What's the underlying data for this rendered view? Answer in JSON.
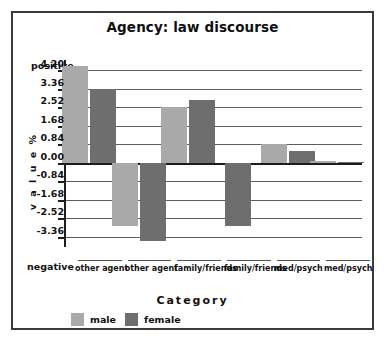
{
  "chart_data": {
    "type": "bar",
    "title": "Agency: law discourse",
    "xlabel": "Category",
    "ylabel": "v a l u e   %",
    "axis_pos_label": "positive",
    "axis_neg_label": "negative",
    "categories": [
      "other agent",
      "other agent",
      "family/friends",
      "family/friends",
      "med/psych",
      "med/psych"
    ],
    "series": [
      {
        "name": "male",
        "color": "#a9a9a9",
        "values": [
          4.38,
          null,
          2.52,
          null,
          0.84,
          0.06
        ]
      },
      {
        "name": "female",
        "color": "#6e6e6e",
        "values": [
          3.36,
          null,
          2.87,
          null,
          0.55,
          0.05
        ]
      }
    ],
    "bars": [
      {
        "group": 0,
        "series": "male",
        "category": "other agent",
        "value": 4.38
      },
      {
        "group": 0,
        "series": "female",
        "category": "other agent",
        "value": 3.36
      },
      {
        "group": 1,
        "series": "male",
        "category": "other agent",
        "value": -2.85
      },
      {
        "group": 1,
        "series": "female",
        "category": "other agent",
        "value": -3.55
      },
      {
        "group": 2,
        "series": "male",
        "category": "family/friends",
        "value": 2.52
      },
      {
        "group": 2,
        "series": "female",
        "category": "family/friends",
        "value": 2.87
      },
      {
        "group": 3,
        "series": "female",
        "category": "family/friends",
        "value": -2.85
      },
      {
        "group": 4,
        "series": "male",
        "category": "med/psych",
        "value": 0.84
      },
      {
        "group": 4,
        "series": "female",
        "category": "med/psych",
        "value": 0.55
      },
      {
        "group": 5,
        "series": "male",
        "category": "med/psych",
        "value": 0.06
      },
      {
        "group": 5,
        "series": "female",
        "category": "med/psych",
        "value": 0.05
      }
    ],
    "ytick_labels": [
      "4.20",
      "3.36",
      "2.52",
      "1.68",
      "0.84",
      "0.00",
      "-0.84",
      "-1.68",
      "-2.52",
      "-3.36"
    ],
    "ytick_values": [
      4.2,
      3.36,
      2.52,
      1.68,
      0.84,
      0.0,
      -0.84,
      -1.68,
      -2.52,
      -3.36
    ],
    "ylim": [
      -3.78,
      4.62
    ],
    "grid": true,
    "legend": {
      "position": "bottom-left",
      "entries": [
        "male",
        "female"
      ]
    },
    "colors": {
      "male": "#a9a9a9",
      "female": "#6e6e6e",
      "axis": "#1d1d1d",
      "grid": "#5d5d5d",
      "border": "#3a3a3a"
    }
  }
}
